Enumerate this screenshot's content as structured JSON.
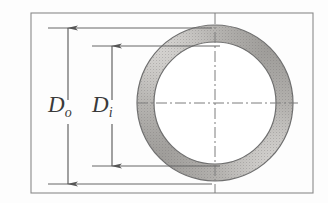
{
  "figure": {
    "background_color": "#fdfdfd",
    "width": 328,
    "height": 203
  },
  "frame": {
    "name": "figure-border",
    "color": "#8a8a8a",
    "x": 31,
    "y": 13,
    "width": 282,
    "height": 180
  },
  "annulus": {
    "label": "annulus-ring",
    "center_x": 215,
    "center_y": 103,
    "outer_radius": 78,
    "inner_radius": 61,
    "fill_light": "#d8d6d4",
    "fill_dark": "#9a9895",
    "inner_fill": "#ffffff",
    "outline_color": "#6f6f6f"
  },
  "centerlines": {
    "style": "dash-dot",
    "color": "#7d7d7d",
    "vertical_x": 215,
    "horizontal_y": 103
  },
  "dimensions": [
    {
      "id": "outer-diameter",
      "label": "D",
      "subscript": "o",
      "full_label": "Do",
      "axis_x": 68,
      "top_y": 28,
      "bottom_y": 184,
      "extension_left_x": 48,
      "extension_right_x": 212,
      "label_x": 52,
      "label_y": 112,
      "arrow_color": "#555555"
    },
    {
      "id": "inner-diameter",
      "label": "D",
      "subscript": "i",
      "full_label": "Di",
      "axis_x": 112,
      "top_y": 46,
      "bottom_y": 166,
      "extension_left_x": 92,
      "extension_right_x": 220,
      "label_x": 96,
      "label_y": 112,
      "arrow_color": "#555555"
    }
  ]
}
